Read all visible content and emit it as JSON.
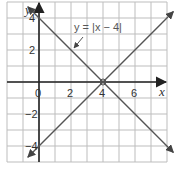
{
  "chart_data": {
    "type": "line",
    "title": "",
    "annotation": "y = |x − 4|",
    "xlabel": "x",
    "ylabel": "y",
    "xlim": [
      -2,
      8
    ],
    "ylim": [
      -5,
      5
    ],
    "grid": true,
    "x_ticks": [
      {
        "value": 0,
        "label": "0"
      },
      {
        "value": 2,
        "label": "2"
      },
      {
        "value": 4,
        "label": "4"
      },
      {
        "value": 6,
        "label": "6"
      }
    ],
    "y_ticks": [
      {
        "value": 4,
        "label": "4"
      },
      {
        "value": 2,
        "label": "2"
      },
      {
        "value": -2,
        "label": "-2"
      },
      {
        "value": -4,
        "label": "-4"
      }
    ],
    "series": [
      {
        "name": "line-decreasing",
        "points": [
          [
            -0.7,
            4.7
          ],
          [
            8.4,
            -4.4
          ]
        ],
        "arrows": "both"
      },
      {
        "name": "line-increasing",
        "points": [
          [
            -0.7,
            -4.7
          ],
          [
            8.4,
            4.4
          ]
        ],
        "arrows": "both"
      }
    ],
    "colors": {
      "grid": "#bdbdbd",
      "axis": "#222222",
      "line": "#555555"
    }
  }
}
